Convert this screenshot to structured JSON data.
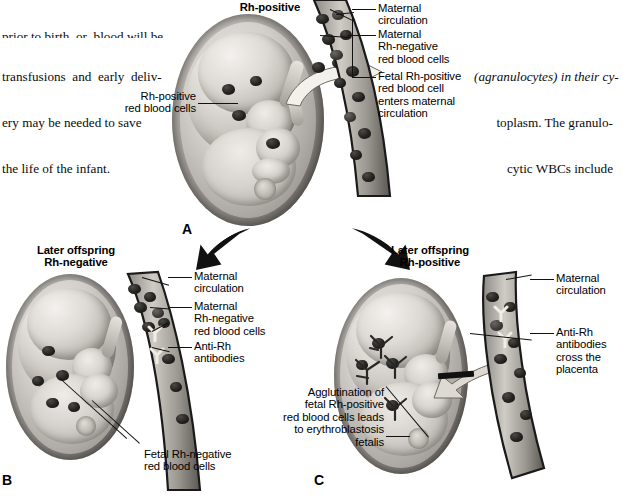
{
  "figure": {
    "panel_letters": {
      "a": "A",
      "b": "B",
      "c": "C"
    }
  },
  "body_text": {
    "left_column": {
      "cut_line": "prior to birth, or  blood will be",
      "lines": [
        "transfusions  and  early  deliv-",
        "ery may be needed to save",
        "the life of the infant."
      ]
    },
    "right_column": {
      "cut_line": "",
      "lines": [
        "(agranulocytes) in their cy-",
        "toplasm. The granulo-",
        "cytic WBCs include"
      ],
      "italic_term": "(agranulocytes)"
    }
  },
  "panel_a": {
    "title": "Rh-positive",
    "labels": [
      {
        "id": "fetal-rbc",
        "text": "Rh-positive\nred blood cells"
      },
      {
        "id": "maternal-circulation",
        "text": "Maternal\ncirculation"
      },
      {
        "id": "maternal-rbc",
        "text": "Maternal\nRh-negative\nred blood cells"
      },
      {
        "id": "fetal-cell-entry",
        "text": "Fetal Rh-positive\nred blood cell\nenters maternal\ncirculation"
      }
    ]
  },
  "panel_b": {
    "title": "Later offspring\nRh-negative",
    "labels": [
      {
        "id": "maternal-circulation",
        "text": "Maternal\ncirculation"
      },
      {
        "id": "maternal-rbc",
        "text": "Maternal\nRh-negative\nred blood cells"
      },
      {
        "id": "anti-rh",
        "text": "Anti-Rh\nantibodies"
      },
      {
        "id": "fetal-rbc",
        "text": "Fetal Rh-negative\nred blood cells"
      }
    ]
  },
  "panel_c": {
    "title": "Later offspring\nRh-positive",
    "labels": [
      {
        "id": "maternal-circulation",
        "text": "Maternal\ncirculation"
      },
      {
        "id": "anti-rh-cross",
        "text": "Anti-Rh\nantibodies\ncross the\nplacenta"
      },
      {
        "id": "agglutination",
        "text": "Agglutination of\nfetal Rh-positive\nred blood cells leads\nto erythroblastosis\nfetalis"
      }
    ]
  },
  "colors": {
    "ink": "#000000",
    "page": "#ffffff",
    "tissue_light": "#ebe7e2",
    "tissue_mid": "#b6b1ab",
    "tissue_dark": "#6e6a66",
    "rbc": "#1b1917",
    "antibody": "#efece6"
  }
}
